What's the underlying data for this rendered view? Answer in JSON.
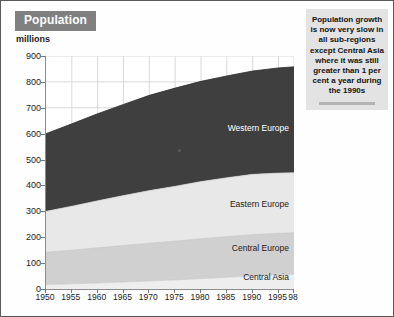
{
  "header": {
    "title": "Population",
    "units": "millions"
  },
  "callout": {
    "text": "Population growth is now very slow in all sub-regions except Central Asia where it was still greater than 1 per cent a year during the 1990s"
  },
  "colors": {
    "title_chip_bg": "#808080",
    "title_chip_text": "#ffffff",
    "callout_bg": "#e3e3e3",
    "callout_rule": "#b4b4b4",
    "western_europe": "#3f3f3f",
    "eastern_europe": "#e8e8e8",
    "central_europe": "#d0d0d0",
    "central_asia": "#eeeeee",
    "axis": "#8c8c8c",
    "grid": "#d9d9d9",
    "page_border": "#5a5a5a"
  },
  "chart_data": {
    "type": "area",
    "stacked": true,
    "title": "Population",
    "xlabel": "",
    "ylabel": "millions",
    "ylim": [
      0,
      900
    ],
    "ytick_step": 100,
    "grid": true,
    "legend": "in-plot labels",
    "yticks": [
      0,
      100,
      200,
      300,
      400,
      500,
      600,
      700,
      800,
      900
    ],
    "xticks": [
      "1950",
      "1955",
      "1960",
      "1965",
      "1970",
      "1975",
      "1980",
      "1985",
      "1990",
      "1995",
      "98"
    ],
    "x": [
      1950,
      1955,
      1960,
      1965,
      1970,
      1975,
      1980,
      1985,
      1990,
      1995,
      1998
    ],
    "series": [
      {
        "name": "Central Asia",
        "values": [
          17,
          20,
          23,
          27,
          31,
          35,
          40,
          45,
          51,
          55,
          57
        ]
      },
      {
        "name": "Central Europe",
        "values": [
          125,
          130,
          136,
          141,
          146,
          150,
          154,
          157,
          159,
          160,
          160
        ]
      },
      {
        "name": "Eastern Europe",
        "values": [
          158,
          170,
          182,
          193,
          203,
          212,
          221,
          228,
          233,
          233,
          232
        ]
      },
      {
        "name": "Western Europe",
        "values": [
          300,
          318,
          336,
          352,
          368,
          379,
          387,
          393,
          399,
          406,
          409
        ]
      }
    ],
    "cumulative_totals": [
      600,
      638,
      677,
      713,
      748,
      776,
      802,
      823,
      842,
      854,
      858
    ],
    "annotations": [
      {
        "label": "Western Europe",
        "series": "Western Europe"
      },
      {
        "label": "Eastern Europe",
        "series": "Eastern Europe"
      },
      {
        "label": "Central Europe",
        "series": "Central Europe"
      },
      {
        "label": "Central Asia",
        "series": "Central Asia"
      }
    ]
  }
}
